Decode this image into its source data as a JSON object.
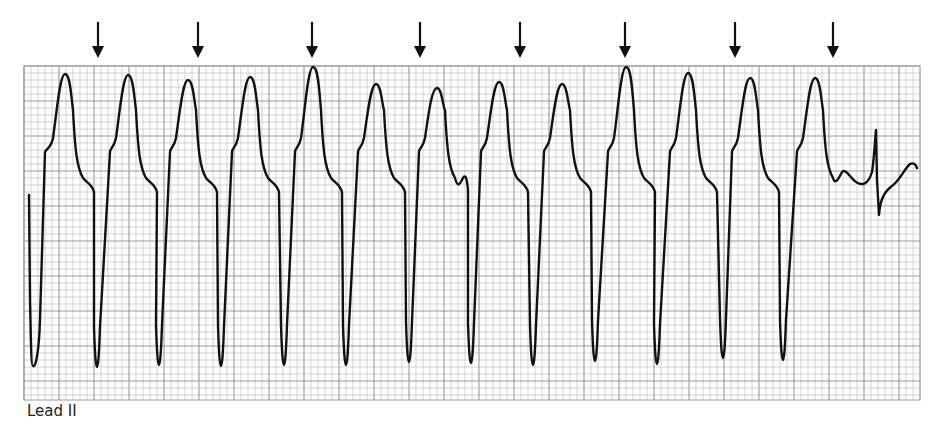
{
  "chart_data": {
    "type": "line",
    "title": "",
    "lead_label": "Lead II",
    "grid": {
      "on": true,
      "x_range_px": [
        24,
        920
      ],
      "y_range_px": [
        66,
        400
      ],
      "small_square_px": 7,
      "large_square_every": 5,
      "minor_color": "#c8c8c8",
      "major_color": "#9a9a9a"
    },
    "trace_color": "#111111",
    "arrows": {
      "count": 8,
      "x_px": [
        98,
        198,
        312,
        420,
        520,
        625,
        735,
        833
      ],
      "y_top_px": 22,
      "y_tip_px": 58,
      "meaning": "P waves (AV dissociation)"
    },
    "beats": {
      "count": 13,
      "trough_x_px": [
        33,
        97,
        159,
        221,
        284,
        346,
        409,
        471,
        533,
        595,
        657,
        723,
        783
      ],
      "trough_y_px": [
        366,
        367,
        365,
        366,
        365,
        365,
        362,
        363,
        365,
        361,
        364,
        358,
        360
      ],
      "peak_x_px": [
        65,
        128,
        188,
        250,
        313,
        376,
        437,
        499,
        562,
        626,
        688,
        750,
        815
      ],
      "peak_y_px": [
        74,
        75,
        80,
        77,
        67,
        84,
        88,
        82,
        84,
        67,
        73,
        78,
        78
      ]
    },
    "final_beat": {
      "spike_x_px": 876,
      "spike_top_y_px": 130,
      "spike_bottom_y_px": 215,
      "end_x_px": 917,
      "end_y_px": 168
    }
  }
}
